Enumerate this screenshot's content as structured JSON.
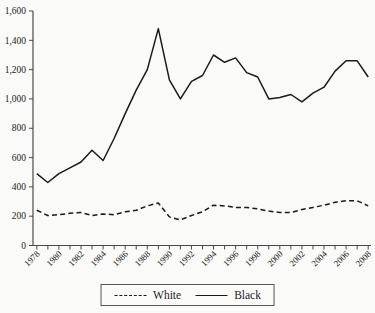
{
  "figure": {
    "background": "#fafaf8",
    "line_color": "#1a1a1a",
    "axis_color": "#4a4a4a",
    "text_color": "#222222"
  },
  "legend": {
    "items": [
      {
        "label": "White",
        "style": "dashed"
      },
      {
        "label": "Black",
        "style": "solid"
      }
    ]
  },
  "chart_data": {
    "type": "line",
    "title": "",
    "xlabel": "",
    "ylabel": "",
    "x": [
      1978,
      1979,
      1980,
      1981,
      1982,
      1983,
      1984,
      1985,
      1986,
      1987,
      1988,
      1989,
      1990,
      1991,
      1992,
      1993,
      1994,
      1995,
      1996,
      1997,
      1998,
      1999,
      2000,
      2001,
      2002,
      2003,
      2004,
      2005,
      2006,
      2007,
      2008
    ],
    "x_tick_labels": [
      "1978",
      "1980",
      "1982",
      "1984",
      "1986",
      "1988",
      "1990",
      "1992",
      "1994",
      "1996",
      "1998",
      "2000",
      "2002",
      "2004",
      "2006",
      "2008"
    ],
    "x_label_every": 2,
    "y_ticks": [
      0,
      200,
      400,
      600,
      800,
      1000,
      1200,
      1400,
      1600
    ],
    "y_tick_labels": [
      "0",
      "200",
      "400",
      "600",
      "800",
      "1,000",
      "1,200",
      "1,400",
      "1,600"
    ],
    "ylim": [
      0,
      1600
    ],
    "grid": false,
    "legend_position": "bottom-center",
    "series": [
      {
        "name": "White",
        "line_style": "dashed",
        "values": [
          240,
          205,
          210,
          220,
          225,
          205,
          215,
          210,
          230,
          240,
          270,
          290,
          195,
          175,
          205,
          230,
          275,
          270,
          260,
          260,
          250,
          235,
          225,
          225,
          245,
          260,
          275,
          295,
          305,
          305,
          270
        ]
      },
      {
        "name": "Black",
        "line_style": "solid",
        "values": [
          490,
          430,
          490,
          530,
          570,
          650,
          580,
          730,
          900,
          1060,
          1200,
          1480,
          1130,
          1000,
          1120,
          1160,
          1300,
          1250,
          1280,
          1180,
          1150,
          1000,
          1010,
          1030,
          980,
          1040,
          1080,
          1190,
          1260,
          1260,
          1150
        ]
      }
    ]
  }
}
